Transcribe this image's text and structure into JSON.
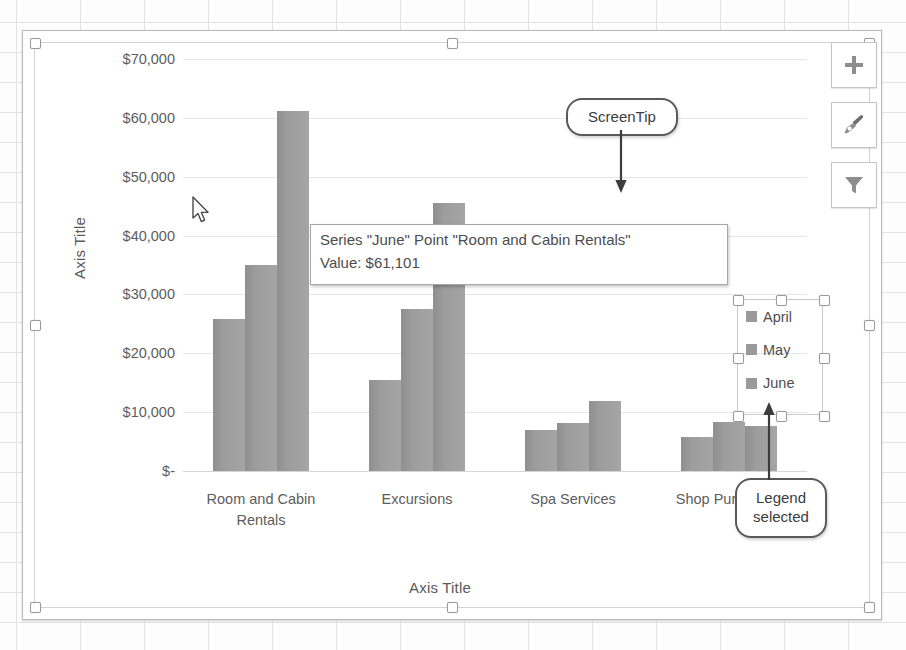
{
  "app": {
    "context": "excel-worksheet-with-selected-chart"
  },
  "chart_data": {
    "type": "bar",
    "title": "",
    "xlabel": "Axis Title",
    "ylabel": "Axis Title",
    "categories": [
      "Room and Cabin Rentals",
      "Excursions",
      "Spa Services",
      "Shop Purchases"
    ],
    "series": [
      {
        "name": "April",
        "values": [
          25800,
          15400,
          6900,
          5700
        ]
      },
      {
        "name": "May",
        "values": [
          35000,
          27500,
          8100,
          8400
        ]
      },
      {
        "name": "June",
        "values": [
          61101,
          45500,
          11900,
          7700
        ]
      }
    ],
    "ylim": [
      0,
      70000
    ],
    "ytick_values": [
      70000,
      60000,
      50000,
      40000,
      30000,
      20000,
      10000,
      0
    ],
    "ytick_labels": [
      "$70,000",
      "$60,000",
      "$50,000",
      "$40,000",
      "$30,000",
      "$20,000",
      "$10,000",
      "$-"
    ],
    "grid": true,
    "legend_position": "right",
    "series_color": "#9a9a9a"
  },
  "axis_titles": {
    "y": "Axis Title",
    "x": "Axis Title"
  },
  "legend": {
    "selected": true,
    "items": [
      {
        "label": "April",
        "color": "#9a9a9a"
      },
      {
        "label": "May",
        "color": "#9a9a9a"
      },
      {
        "label": "June",
        "color": "#9a9a9a"
      }
    ]
  },
  "tooltip": {
    "line1": "Series \"June\" Point \"Room and Cabin Rentals\"",
    "line2": "Value:  $61,101"
  },
  "callouts": {
    "screentip": "ScreenTip",
    "legend_selected_line1": "Legend",
    "legend_selected_line2": "selected"
  },
  "chart_buttons": [
    {
      "name": "chart-elements",
      "icon": "plus-icon"
    },
    {
      "name": "chart-styles",
      "icon": "paintbrush-icon"
    },
    {
      "name": "chart-filters",
      "icon": "funnel-icon"
    }
  ],
  "colors": {
    "bar": "#9a9a9a",
    "gridline": "#e6e6e6",
    "text": "#5d5d5d",
    "callout_border": "#5a5a5a"
  }
}
